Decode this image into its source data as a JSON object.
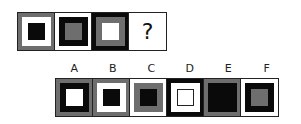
{
  "colors": {
    "black": "#0a0a0a",
    "gray": "#6e6e6e",
    "white": "#ffffff"
  },
  "sequence": [
    {
      "outer": "#6e6e6e",
      "middle": "#ffffff",
      "inner": "#0a0a0a"
    },
    {
      "outer": "#ffffff",
      "middle": "#0a0a0a",
      "inner": "#6e6e6e"
    },
    {
      "outer": "#0a0a0a",
      "middle": "#6e6e6e",
      "inner": "#ffffff"
    },
    {
      "question": "?"
    }
  ],
  "options": [
    {
      "label": "A",
      "outer": "#6e6e6e",
      "middle": "#0a0a0a",
      "inner": "#ffffff"
    },
    {
      "label": "B",
      "outer": "#6e6e6e",
      "middle": "#ffffff",
      "inner": "#0a0a0a"
    },
    {
      "label": "C",
      "outer": "#ffffff",
      "middle": "#6e6e6e",
      "inner": "#0a0a0a"
    },
    {
      "label": "D",
      "outer": "#0a0a0a",
      "middle": "#ffffff",
      "inner": "#ffffff"
    },
    {
      "label": "E",
      "outer": "#6e6e6e",
      "middle": "#0a0a0a",
      "inner": "#0a0a0a"
    },
    {
      "label": "F",
      "outer": "#ffffff",
      "middle": "#0a0a0a",
      "inner": "#6e6e6e"
    }
  ]
}
